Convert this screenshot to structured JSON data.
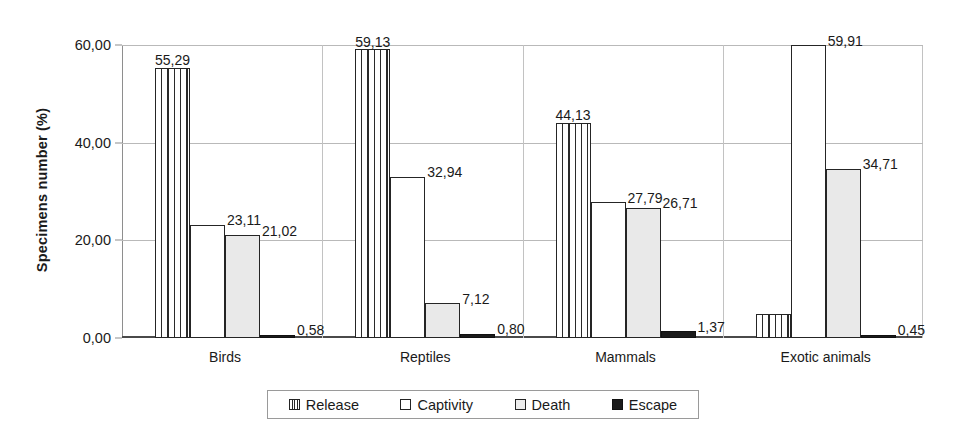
{
  "chart_data": {
    "type": "bar",
    "title": "",
    "xlabel": "",
    "ylabel": "Specimens number (%)",
    "ylim": [
      0,
      60
    ],
    "yticks": [
      "0,00",
      "20,00",
      "40,00",
      "60,00"
    ],
    "ytick_values": [
      0,
      20,
      40,
      60
    ],
    "grid": true,
    "legend_position": "bottom",
    "categories": [
      "Birds",
      "Reptiles",
      "Mammals",
      "Exotic animals"
    ],
    "series": [
      {
        "name": "Release",
        "fill": "vertical-hatch",
        "values": [
          55.29,
          59.13,
          44.13,
          4.93
        ],
        "labels": [
          "55,29",
          "59,13",
          "44,13",
          "4,93"
        ]
      },
      {
        "name": "Captivity",
        "fill": "white",
        "values": [
          23.11,
          32.94,
          27.79,
          59.91
        ],
        "labels": [
          "23,11",
          "32,94",
          "27,79",
          "59,91"
        ]
      },
      {
        "name": "Death",
        "fill": "light-gray",
        "values": [
          21.02,
          7.12,
          26.71,
          34.71
        ],
        "labels": [
          "21,02",
          "7,12",
          "26,71",
          "34,71"
        ]
      },
      {
        "name": "Escape",
        "fill": "black",
        "values": [
          0.58,
          0.8,
          1.37,
          0.45
        ],
        "labels": [
          "0,58",
          "0,80",
          "1,37",
          "0,45"
        ]
      }
    ]
  },
  "legend": {
    "items": [
      {
        "label": "Release",
        "fill": "f-hatch"
      },
      {
        "label": "Captivity",
        "fill": "f-white"
      },
      {
        "label": "Death",
        "fill": "f-gray"
      },
      {
        "label": "Escape",
        "fill": "f-black"
      }
    ]
  },
  "colors": {
    "bar_outline": "#252525",
    "death_fill": "#e9e9e9",
    "escape_fill": "#1b1b1b",
    "gridline": "#b9b9b9",
    "axis": "#4a4a4a",
    "text": "#1a1a1a"
  }
}
